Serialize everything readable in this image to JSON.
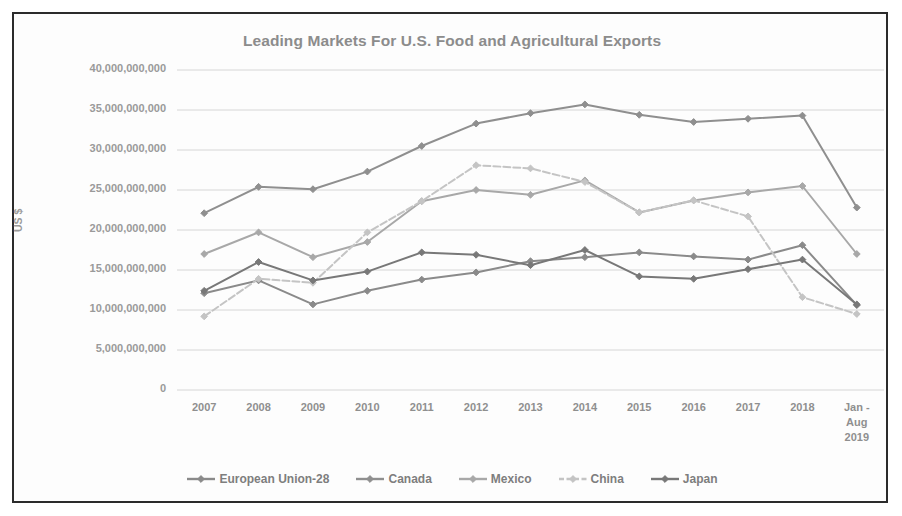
{
  "chart_data": {
    "type": "line",
    "title": "Leading Markets For U.S. Food and Agricultural Exports",
    "xlabel": "",
    "ylabel": "US $",
    "grid": true,
    "legend_position": "bottom",
    "ylim": [
      0,
      40000000000
    ],
    "ytick_labels": [
      "40,000,000,000",
      "35,000,000,000",
      "30,000,000,000",
      "25,000,000,000",
      "20,000,000,000",
      "15,000,000,000",
      "10,000,000,000",
      "5,000,000,000",
      "0"
    ],
    "ytick_values": [
      40000000000,
      35000000000,
      30000000000,
      25000000000,
      20000000000,
      15000000000,
      10000000000,
      5000000000,
      0
    ],
    "categories": [
      "2007",
      "2008",
      "2009",
      "2010",
      "2011",
      "2012",
      "2013",
      "2014",
      "2015",
      "2016",
      "2017",
      "2018",
      "Jan -\nAug\n2019"
    ],
    "series": [
      {
        "name": "European Union-28",
        "color": "#8a8a8a",
        "style": "solid",
        "values": [
          12100000000,
          13700000000,
          10700000000,
          12400000000,
          13800000000,
          14700000000,
          16100000000,
          16600000000,
          17200000000,
          16700000000,
          16300000000,
          18100000000,
          10600000000
        ]
      },
      {
        "name": "Canada",
        "color": "#8f8f8f",
        "style": "solid",
        "values": [
          22100000000,
          25400000000,
          25100000000,
          27300000000,
          30500000000,
          33300000000,
          34600000000,
          35700000000,
          34400000000,
          33500000000,
          33900000000,
          34300000000,
          22800000000
        ]
      },
      {
        "name": "Mexico",
        "color": "#a8a8a8",
        "style": "solid",
        "values": [
          17000000000,
          19700000000,
          16600000000,
          18500000000,
          23600000000,
          25000000000,
          24400000000,
          26200000000,
          22200000000,
          23700000000,
          24700000000,
          25500000000,
          17000000000
        ]
      },
      {
        "name": "China",
        "color": "#c4c4c4",
        "style": "dashed",
        "values": [
          9200000000,
          13900000000,
          13400000000,
          19700000000,
          23600000000,
          28100000000,
          27700000000,
          26000000000,
          22200000000,
          23700000000,
          21700000000,
          11600000000,
          9500000000
        ]
      },
      {
        "name": "Japan",
        "color": "#787878",
        "style": "solid",
        "values": [
          12400000000,
          16000000000,
          13700000000,
          14800000000,
          17200000000,
          16900000000,
          15600000000,
          17500000000,
          14200000000,
          13900000000,
          15100000000,
          16300000000,
          10700000000
        ]
      }
    ]
  }
}
